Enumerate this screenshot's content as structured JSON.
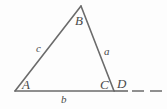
{
  "figure": {
    "kind": "geometry-diagram",
    "background_color": "#fdfdfd",
    "stroke_color": "#6b6b6b",
    "label_color": "#4a4a4a",
    "vertices": {
      "A": {
        "label": "A",
        "x": 15,
        "y": 91
      },
      "B": {
        "label": "B",
        "x": 81,
        "y": 6
      },
      "C": {
        "label": "C",
        "x": 114,
        "y": 91
      },
      "D": {
        "label": "D",
        "x": 124,
        "y": 91
      }
    },
    "sides": {
      "a": {
        "label": "a",
        "from": "B",
        "to": "C"
      },
      "b": {
        "label": "b",
        "from": "A",
        "to": "C"
      },
      "c": {
        "label": "c",
        "from": "A",
        "to": "B"
      }
    },
    "extension": {
      "label": "dashed-extension",
      "from_x": 114,
      "to_x": 162,
      "y": 91,
      "style": "dashed"
    }
  }
}
